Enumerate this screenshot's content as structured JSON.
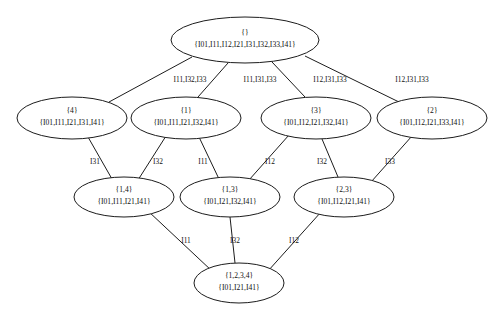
{
  "diagram": {
    "type": "concept-lattice",
    "title": "",
    "background_color": "#ffffff",
    "line_color": "#1c1c1c",
    "text_color": "#111111",
    "nodes": [
      {
        "id": "root",
        "extent": "{}",
        "intent": "{I01,I11,I12,I21,I31,I32,I33,I41}",
        "cx": 245,
        "cy": 40,
        "rx": 74,
        "ry": 23,
        "level": 0
      },
      {
        "id": "n4",
        "extent": "{4}",
        "intent": "{I01,I11,I21,I31,I41}",
        "cx": 72,
        "cy": 118,
        "rx": 55,
        "ry": 21,
        "level": 1
      },
      {
        "id": "n1",
        "extent": "{1}",
        "intent": "{I01,I11,I21,I32,I41}",
        "cx": 186,
        "cy": 118,
        "rx": 55,
        "ry": 21,
        "level": 1
      },
      {
        "id": "n3",
        "extent": "{3}",
        "intent": "{I01,I12,I21,I32,I41}",
        "cx": 316,
        "cy": 118,
        "rx": 55,
        "ry": 21,
        "level": 1
      },
      {
        "id": "n2",
        "extent": "{2}",
        "intent": "{I01,I12,I21,I33,I41}",
        "cx": 432,
        "cy": 118,
        "rx": 55,
        "ry": 21,
        "level": 1
      },
      {
        "id": "n14",
        "extent": "{1,4}",
        "intent": "{I01,I11,I21,I41}",
        "cx": 124,
        "cy": 197,
        "rx": 50,
        "ry": 20,
        "level": 2
      },
      {
        "id": "n13",
        "extent": "{1,3}",
        "intent": "{I01,I21,I32,I41}",
        "cx": 230,
        "cy": 197,
        "rx": 50,
        "ry": 20,
        "level": 2
      },
      {
        "id": "n23",
        "extent": "{2,3}",
        "intent": "{I01,I12,I21,I41}",
        "cx": 344,
        "cy": 197,
        "rx": 50,
        "ry": 20,
        "level": 2
      },
      {
        "id": "n1234",
        "extent": "{1,2,3,4}",
        "intent": "{I01,I21,I41}",
        "cx": 239,
        "cy": 283,
        "rx": 45,
        "ry": 20,
        "level": 3
      }
    ],
    "edges": [
      {
        "from": "root",
        "to": "n4",
        "label": "I11,I32,I33",
        "label_x": 190,
        "label_y": 80,
        "x1": 192,
        "y1": 57,
        "x2": 109,
        "y2": 102
      },
      {
        "from": "root",
        "to": "n1",
        "label": "I11,I31,I33",
        "label_x": 260,
        "label_y": 80,
        "x1": 228,
        "y1": 63,
        "x2": 198,
        "y2": 97
      },
      {
        "from": "root",
        "to": "n3",
        "label": "I12,I31,I33",
        "label_x": 330,
        "label_y": 80,
        "x1": 272,
        "y1": 62,
        "x2": 305,
        "y2": 97
      },
      {
        "from": "root",
        "to": "n2",
        "label": "I12,I31,I33",
        "label_x": 412,
        "label_y": 80,
        "x1": 305,
        "y1": 56,
        "x2": 399,
        "y2": 102
      },
      {
        "from": "n4",
        "to": "n14",
        "label": "I31",
        "label_x": 95,
        "label_y": 162,
        "x1": 88,
        "y1": 137,
        "x2": 112,
        "y2": 179
      },
      {
        "from": "n1",
        "to": "n14",
        "label": "I32",
        "label_x": 158,
        "label_y": 162,
        "x1": 166,
        "y1": 136,
        "x2": 138,
        "y2": 180
      },
      {
        "from": "n1",
        "to": "n13",
        "label": "I11",
        "label_x": 203,
        "label_y": 162,
        "x1": 199,
        "y1": 137,
        "x2": 219,
        "y2": 179
      },
      {
        "from": "n3",
        "to": "n13",
        "label": "I12",
        "label_x": 270,
        "label_y": 162,
        "x1": 289,
        "y1": 135,
        "x2": 249,
        "y2": 180
      },
      {
        "from": "n3",
        "to": "n23",
        "label": "I32",
        "label_x": 322,
        "label_y": 162,
        "x1": 322,
        "y1": 139,
        "x2": 338,
        "y2": 177
      },
      {
        "from": "n2",
        "to": "n23",
        "label": "I33",
        "label_x": 390,
        "label_y": 162,
        "x1": 412,
        "y1": 136,
        "x2": 371,
        "y2": 182
      },
      {
        "from": "n14",
        "to": "n1234",
        "label": "I11",
        "label_x": 186,
        "label_y": 241,
        "x1": 148,
        "y1": 211,
        "x2": 212,
        "y2": 271
      },
      {
        "from": "n13",
        "to": "n1234",
        "label": "I32",
        "label_x": 235,
        "label_y": 241,
        "x1": 230,
        "y1": 217,
        "x2": 235,
        "y2": 263
      },
      {
        "from": "n23",
        "to": "n1234",
        "label": "I12",
        "label_x": 294,
        "label_y": 241,
        "x1": 321,
        "y1": 212,
        "x2": 268,
        "y2": 271
      }
    ]
  }
}
